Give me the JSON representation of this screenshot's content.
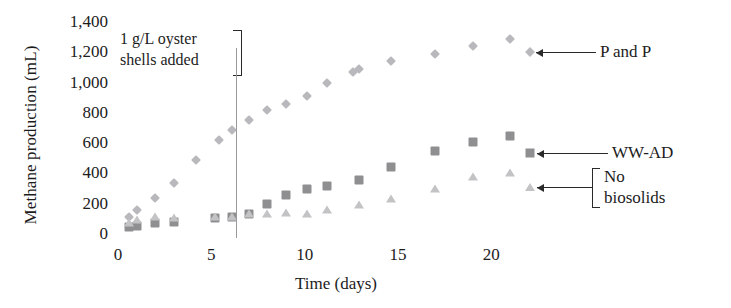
{
  "chart_data": {
    "type": "scatter",
    "title": "",
    "xlabel": "Time (days)",
    "ylabel": "Methane production (mL)",
    "xlim": [
      0,
      22.5
    ],
    "ylim": [
      0,
      1400
    ],
    "xticks": [
      0,
      5,
      10,
      15,
      20
    ],
    "xtick_labels": [
      "0",
      "5",
      "10",
      "15",
      "20"
    ],
    "yticks": [
      0,
      200,
      400,
      600,
      800,
      1000,
      1200,
      1400
    ],
    "ytick_labels": [
      "0",
      "200",
      "400",
      "600",
      "800",
      "1,000",
      "1,200",
      "1,400"
    ],
    "grid": false,
    "legend_position": "right-callouts",
    "annotations": [
      {
        "text_line1": "1 g/L oyster",
        "text_line2": "shells added",
        "marker": "vertical-line",
        "x": 6.3
      }
    ],
    "series": [
      {
        "name": "P and P",
        "marker": "diamond",
        "color": "#b9b9bd",
        "x": [
          0.6,
          1.0,
          2.0,
          3.0,
          4.2,
          5.4,
          6.1,
          7.0,
          8.0,
          9.0,
          10.1,
          11.2,
          12.6,
          12.9,
          14.6,
          17.0,
          19.0,
          21.0
        ],
        "y": [
          110,
          160,
          240,
          340,
          490,
          620,
          690,
          750,
          820,
          860,
          910,
          1000,
          1070,
          1090,
          1140,
          1190,
          1240,
          1290
        ]
      },
      {
        "name": "WW-AD",
        "marker": "square",
        "color": "#8f8f92",
        "x": [
          0.6,
          1.0,
          2.0,
          3.0,
          5.2,
          6.1,
          7.0,
          8.0,
          9.0,
          10.1,
          11.2,
          12.9,
          14.6,
          17.0,
          19.0,
          21.0
        ],
        "y": [
          45,
          55,
          70,
          80,
          105,
          115,
          135,
          195,
          255,
          295,
          315,
          355,
          445,
          545,
          605,
          650
        ]
      },
      {
        "name": "No biosolids",
        "marker": "triangle",
        "color": "#c3c3c6",
        "x": [
          0.6,
          1.0,
          2.0,
          3.0,
          5.2,
          6.1,
          7.0,
          8.0,
          9.0,
          10.1,
          11.2,
          12.9,
          14.6,
          17.0,
          19.0,
          21.0
        ],
        "y": [
          70,
          95,
          110,
          105,
          110,
          115,
          130,
          130,
          140,
          135,
          160,
          190,
          230,
          300,
          375,
          405
        ]
      }
    ]
  },
  "legend": {
    "items": [
      {
        "label": "P and P",
        "marker": "diamond"
      },
      {
        "label": "WW-AD",
        "marker": "square"
      },
      {
        "label": "No biosolids",
        "label_line1": "No",
        "label_line2": "biosolids",
        "marker": "triangle"
      }
    ]
  }
}
